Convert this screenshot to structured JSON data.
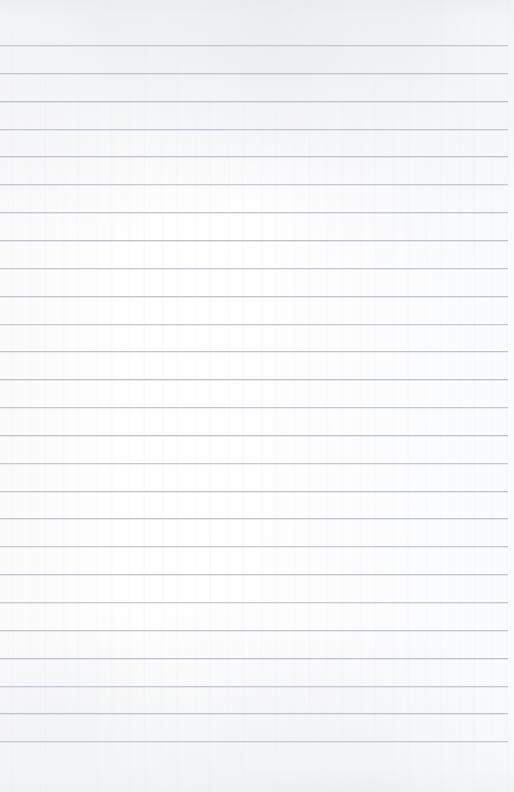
{
  "document": {
    "kind": "lined-notebook-paper-scan",
    "title": "Blank Lined Notebook Page",
    "written_content": "",
    "page_width_px": 514,
    "page_height_px": 792,
    "paper_color": "#fdfdfd",
    "rule_color": "#b9bec7",
    "rule_thickness_px": 1,
    "rule_spacing_px": 27.85,
    "first_rule_y_px": 45,
    "rule_count": 26,
    "rule_left_inset_px": 0,
    "rule_right_inset_px": 6,
    "top_margin_px": 45,
    "bottom_margin_px": 51,
    "has_vertical_margin_rule": false,
    "has_holes": false,
    "texture_note": "faint mottled grey scan texture along the top and bottom edges"
  }
}
